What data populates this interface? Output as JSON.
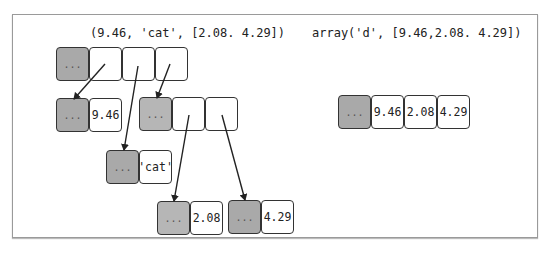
{
  "left_diagram": {
    "caption": "(9.46, 'cat', [2.08. 4.29])",
    "tuple": {
      "header": "...",
      "slots": [
        "",
        "",
        ""
      ]
    },
    "float_obj": {
      "header": "...",
      "value": "9.46"
    },
    "str_obj": {
      "header": "...",
      "value": "'cat'"
    },
    "list_obj": {
      "header": "...",
      "slots": [
        "",
        ""
      ]
    },
    "float_a": {
      "header": "...",
      "value": "2.08"
    },
    "float_b": {
      "header": "...",
      "value": "4.29"
    }
  },
  "right_diagram": {
    "caption": "array('d', [9.46,2.08. 4.29])",
    "array_obj": {
      "header": "...",
      "values": [
        "9.46",
        "2.08",
        "4.29"
      ]
    }
  },
  "colors": {
    "header_fill": "#a9a9a9",
    "border": "#333333",
    "frame": "#9a9a9a"
  }
}
